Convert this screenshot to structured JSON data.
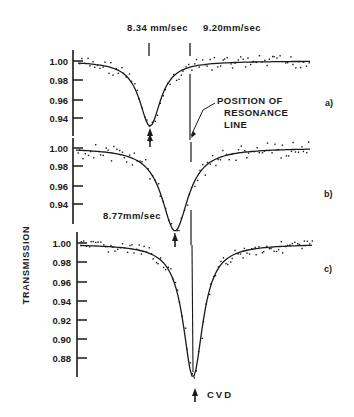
{
  "chart_data": {
    "type": "scatter",
    "title": "",
    "ylabel": "TRANSMISSION",
    "xlabel": "",
    "annotations": {
      "top_left_velocity": "8.34 mm/sec",
      "top_right_velocity": "9.20mm/sec",
      "panel_b_velocity": "8.77mm/sec",
      "resonance_line_label": [
        "POSITION OF",
        "RESONANCE",
        "LINE"
      ],
      "panel_c_arrow_label": "CVD"
    },
    "panels": [
      {
        "label": "a)",
        "yticks": [
          "1.00",
          "0.98",
          "0.96",
          "0.94"
        ],
        "ylim": [
          0.925,
          1.01
        ],
        "minimum": {
          "velocity_mm_s": 8.34,
          "transmission": 0.932
        },
        "fit": "lorentzian",
        "baseline": 1.0
      },
      {
        "label": "b)",
        "yticks": [
          "1.00",
          "0.98",
          "0.96",
          "0.94"
        ],
        "ylim": [
          0.925,
          1.01
        ],
        "minimum": {
          "velocity_mm_s": 8.77,
          "transmission": 0.92
        },
        "fit": "lorentzian",
        "baseline": 1.0
      },
      {
        "label": "c)",
        "yticks": [
          "1.00",
          "0.98",
          "0.96",
          "0.94",
          "0.92",
          "0.90",
          "0.88"
        ],
        "ylim": [
          0.86,
          1.01
        ],
        "minimum": {
          "velocity_mm_s": 9.2,
          "transmission": 0.862
        },
        "fit": "lorentzian",
        "baseline": 1.0
      }
    ],
    "resonance_line_velocity_mm_s": 9.2,
    "grid": false,
    "legend": null
  },
  "labels": {
    "ylabel": "TRANSMISSION",
    "v834": "8.34 mm/sec",
    "v920": "9.20mm/sec",
    "v877": "8.77mm/sec",
    "pos1": "POSITION OF",
    "pos2": "RESONANCE",
    "pos3": "LINE",
    "cvd": "CVD",
    "pa": "a)",
    "pb": "b)",
    "pc": "c)",
    "a_t0": "1.00",
    "a_t1": "0.98",
    "a_t2": "0.96",
    "a_t3": "0.94",
    "b_t0": "1.00",
    "b_t1": "0.98",
    "b_t2": "0.96",
    "b_t3": "0.94",
    "c_t0": "1.00",
    "c_t1": "0.98",
    "c_t2": "0.96",
    "c_t3": "0.94",
    "c_t4": "0.92",
    "c_t5": "0.90",
    "c_t6": "0.88"
  }
}
